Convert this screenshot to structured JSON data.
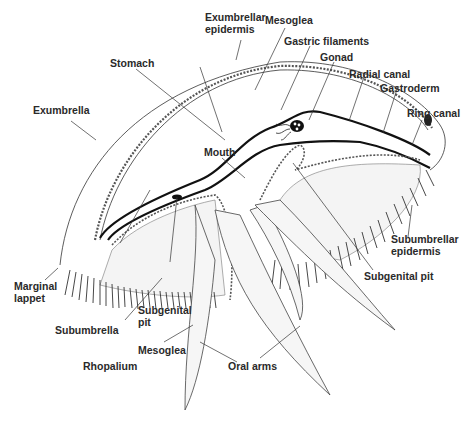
{
  "figure": {
    "title": ""
  },
  "labels": {
    "exumbrellar_epidermis": "Exumbrellar\nepidermis",
    "mesoglea_top": "Mesoglea",
    "gastric_filaments": "Gastric filaments",
    "gonad": "Gonad",
    "stomach": "Stomach",
    "radial_canal": "Radial canal",
    "gastroderm": "Gastroderm",
    "exumbrella": "Exumbrella",
    "ring_canal": "Ring canal",
    "mouth": "Mouth",
    "subumbrellar_epidermis": "Subumbrellar\nepidermis",
    "subgenital_pit_right": "Subgenital pit",
    "marginal_lappet": "Marginal\nlappet",
    "subgenital_pit_left": "Subgenital\npit",
    "subumbrella": "Subumbrella",
    "mesoglea_bottom": "Mesoglea",
    "rhopalium": "Rhopalium",
    "oral_arms": "Oral arms"
  },
  "colors": {
    "line": "#222222",
    "text": "#2a2a2a",
    "background": "#ffffff",
    "shade": "#bbbbbb"
  }
}
